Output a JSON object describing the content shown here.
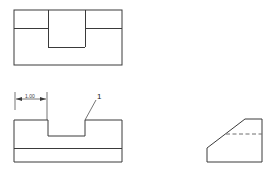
{
  "drawing": {
    "type": "orthographic-multiview-engineering-drawing",
    "background_color": "#ffffff",
    "line_color": "#3a3a3a",
    "hidden_line_color": "#6e6e6e",
    "views": [
      {
        "name": "top-view",
        "description": "Top view of notched block showing rectangular slot opening",
        "outline": {
          "x": 14,
          "y": 10,
          "width": 108,
          "height": 55
        },
        "internal_lines": [
          {
            "name": "slot-left-edge",
            "x1": 48,
            "y1": 10,
            "x2": 48,
            "y2": 47
          },
          {
            "name": "slot-right-edge",
            "x1": 85,
            "y1": 10,
            "x2": 85,
            "y2": 47
          },
          {
            "name": "slot-bottom-edge",
            "x1": 48,
            "y1": 47,
            "x2": 85,
            "y2": 47
          },
          {
            "name": "left-horizontal-edge",
            "x1": 14,
            "y1": 28,
            "x2": 48,
            "y2": 28
          },
          {
            "name": "right-horizontal-edge",
            "x1": 85,
            "y1": 28,
            "x2": 122,
            "y2": 28
          }
        ]
      },
      {
        "name": "front-view",
        "description": "Front view of notched block with rectangular notch cut from top face and base plate line",
        "profile_points": "14,120 14,162 122,162 122,120 85,120 85,136 48,136 48,120",
        "internal_lines": [
          {
            "name": "base-plate-line",
            "x1": 14,
            "y1": 148,
            "x2": 122,
            "y2": 148
          }
        ]
      },
      {
        "name": "right-side-view",
        "description": "Right side view showing chamfered corner with hidden line",
        "profile_points": "207,162 207,148 245,119 262,119 262,162",
        "hidden_lines": [
          {
            "name": "chamfer-hidden-line",
            "x1": 226,
            "y1": 134,
            "x2": 262,
            "y2": 134
          }
        ]
      }
    ],
    "annotations": [
      {
        "name": "width-dimension",
        "type": "linear-dimension",
        "value": "1.00",
        "text_x": 29,
        "text_y": 100,
        "dim_line": {
          "x1": 16,
          "y1": 99,
          "x2": 46,
          "y2": 99
        },
        "ext_lines": [
          {
            "x1": 15,
            "y1": 92,
            "x2": 15,
            "y2": 110
          },
          {
            "x1": 47,
            "y1": 92,
            "x2": 47,
            "y2": 120
          }
        ],
        "arrows": [
          {
            "tip_x": 16,
            "tip_y": 99,
            "direction": "left"
          },
          {
            "tip_x": 46,
            "tip_y": 99,
            "direction": "right"
          }
        ]
      },
      {
        "name": "feature-callout-1",
        "type": "leader-label",
        "value": "1",
        "text_x": 97,
        "text_y": 98,
        "leader": {
          "x1": 85,
          "y1": 120,
          "x2": 96,
          "y2": 100
        }
      }
    ]
  }
}
